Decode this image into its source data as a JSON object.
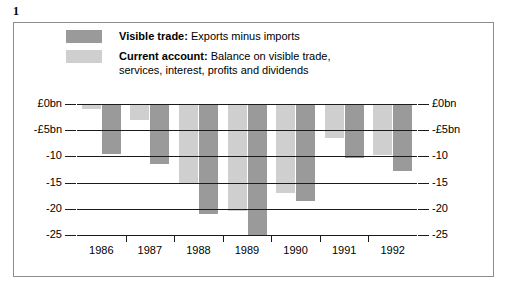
{
  "figure": {
    "number": "1"
  },
  "legend": {
    "items": [
      {
        "swatch": "dark",
        "color": "#9a9a9a",
        "lead": "Visible trade:",
        "text": " Exports minus imports",
        "text2": ""
      },
      {
        "swatch": "light",
        "color": "#cfcfcf",
        "lead": "Current account:",
        "text": " Balance on visible trade,",
        "text2": "services, interest, profits and dividends"
      }
    ]
  },
  "axis": {
    "left_labels": [
      "£0bn",
      "-£5bn",
      "-10",
      "-15",
      "-20",
      "-25"
    ],
    "right_labels": [
      "£0bn",
      "-£5bn",
      "-10",
      "-15",
      "-20",
      "-25"
    ],
    "tick_values": [
      0,
      -5,
      -10,
      -15,
      -20,
      -25
    ]
  },
  "chart_data": {
    "type": "bar",
    "title": "",
    "subtitle": "",
    "xlabel": "",
    "ylabel": "",
    "ylim": [
      -25,
      0
    ],
    "grid": true,
    "legend_position": "top",
    "unit": "£bn",
    "categories": [
      "1986",
      "1987",
      "1988",
      "1989",
      "1990",
      "1991",
      "1992"
    ],
    "series": [
      {
        "name": "Current account",
        "description": "Balance on visible trade, services, interest, profits and dividends",
        "color": "#cfcfcf",
        "values": [
          -1.0,
          -3.0,
          -15.0,
          -20.5,
          -17.0,
          -6.5,
          -9.7
        ]
      },
      {
        "name": "Visible trade",
        "description": "Exports minus imports",
        "color": "#9a9a9a",
        "values": [
          -9.6,
          -11.5,
          -21.0,
          -25.0,
          -18.6,
          -10.3,
          -12.8
        ]
      }
    ]
  }
}
